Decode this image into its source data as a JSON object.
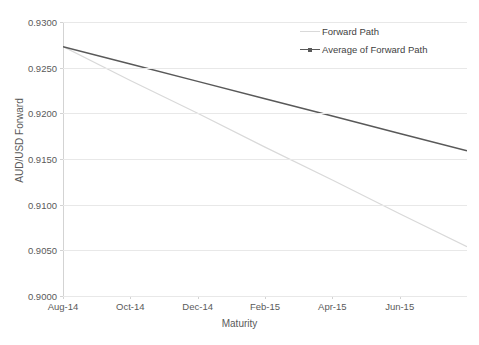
{
  "chart_data": {
    "type": "line",
    "title": "",
    "xlabel": "Maturity",
    "ylabel": "AUD/USD Forward",
    "x": [
      "Aug-14",
      "Oct-14",
      "Dec-14",
      "Feb-15",
      "Apr-15",
      "Jun-15",
      "Aug-15"
    ],
    "categories": [
      "Aug-14",
      "Oct-14",
      "Dec-14",
      "Feb-15",
      "Apr-15",
      "Jun-15"
    ],
    "xtick_labels": [
      "Aug-14",
      "Oct-14",
      "Dec-14",
      "Feb-15",
      "Apr-15",
      "Jun-15"
    ],
    "ytick_labels": [
      "0.9300",
      "0.9250",
      "0.9200",
      "0.9150",
      "0.9100",
      "0.9050",
      "0.9000"
    ],
    "ytick_values": [
      0.93,
      0.925,
      0.92,
      0.915,
      0.91,
      0.905,
      0.9
    ],
    "ylim": [
      0.9,
      0.93
    ],
    "xlim": [
      0,
      12
    ],
    "grid": "horizontal",
    "legend_position": "top-right",
    "series": [
      {
        "name": "Forward Path",
        "color": "#d9d9d9",
        "x": [
          0,
          2,
          4,
          6,
          8,
          10,
          12
        ],
        "values": [
          0.9273,
          0.9236,
          0.92,
          0.9163,
          0.9127,
          0.909,
          0.9054
        ]
      },
      {
        "name": "Average of Forward Path",
        "color": "#595959",
        "x": [
          0,
          2,
          4,
          6,
          8,
          10,
          12
        ],
        "values": [
          0.9273,
          0.9254,
          0.9235,
          0.9216,
          0.9197,
          0.9178,
          0.9159
        ]
      }
    ]
  },
  "axes": {
    "y_title": "AUD/USD Forward",
    "x_title": "Maturity"
  },
  "legend": {
    "items": [
      {
        "label": "Forward Path",
        "color": "#d9d9d9",
        "has_marker": false
      },
      {
        "label": "Average of Forward Path",
        "color": "#595959",
        "has_marker": true
      }
    ]
  }
}
